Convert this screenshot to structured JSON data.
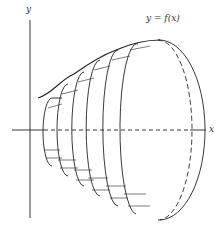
{
  "diagram": {
    "labels": {
      "y_axis": "y",
      "x_axis": "x",
      "curve": "y = f(x)"
    },
    "colors": {
      "ink": "#222222",
      "background": "#ffffff"
    },
    "disk_count": 6
  }
}
